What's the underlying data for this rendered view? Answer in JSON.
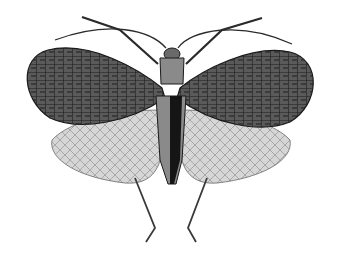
{
  "image": {
    "subject": "Engraved illustration of a winged insect (katydid / leaf-insect) with spread forewings and hindwings, viewed from above",
    "style": "black-and-white engraving",
    "background_color": "#ffffff",
    "palette": {
      "ink": "#1a1a1a",
      "forewing": "#4a4a4a",
      "forewing_dark": "#2a2a2a",
      "hindwing": "#cfcfcf",
      "hindwing_vein": "#6a6a6a",
      "body": "#7a7a7a",
      "body_dark": "#151515"
    },
    "parts": [
      "antennae",
      "forelegs",
      "head",
      "thorax",
      "left-forewing",
      "right-forewing",
      "left-hindwing",
      "right-hindwing",
      "abdomen",
      "hind-legs"
    ]
  }
}
